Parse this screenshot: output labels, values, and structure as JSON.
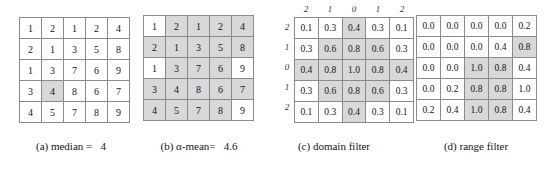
{
  "figure": {
    "panels": [
      {
        "id": "a",
        "caption": "(a) median =   4",
        "show_labels": false,
        "value_type": "int",
        "col_labels": [],
        "row_labels": [],
        "rows": [
          [
            {
              "v": "1",
              "hl": false
            },
            {
              "v": "2",
              "hl": false
            },
            {
              "v": "1",
              "hl": false
            },
            {
              "v": "2",
              "hl": false
            },
            {
              "v": "4",
              "hl": false
            }
          ],
          [
            {
              "v": "2",
              "hl": false
            },
            {
              "v": "1",
              "hl": false
            },
            {
              "v": "3",
              "hl": false
            },
            {
              "v": "5",
              "hl": false
            },
            {
              "v": "8",
              "hl": false
            }
          ],
          [
            {
              "v": "1",
              "hl": false
            },
            {
              "v": "3",
              "hl": false
            },
            {
              "v": "7",
              "hl": false
            },
            {
              "v": "6",
              "hl": false
            },
            {
              "v": "9",
              "hl": false
            }
          ],
          [
            {
              "v": "3",
              "hl": false
            },
            {
              "v": "4",
              "hl": true
            },
            {
              "v": "8",
              "hl": false
            },
            {
              "v": "6",
              "hl": false
            },
            {
              "v": "7",
              "hl": false
            }
          ],
          [
            {
              "v": "4",
              "hl": false
            },
            {
              "v": "5",
              "hl": false
            },
            {
              "v": "7",
              "hl": false
            },
            {
              "v": "8",
              "hl": false
            },
            {
              "v": "9",
              "hl": false
            }
          ]
        ]
      },
      {
        "id": "b",
        "caption": "(b) α-mean=   4.6",
        "show_labels": false,
        "value_type": "int",
        "col_labels": [],
        "row_labels": [],
        "rows": [
          [
            {
              "v": "1",
              "hl": false
            },
            {
              "v": "2",
              "hl": true
            },
            {
              "v": "1",
              "hl": true
            },
            {
              "v": "2",
              "hl": true
            },
            {
              "v": "4",
              "hl": true
            }
          ],
          [
            {
              "v": "2",
              "hl": true
            },
            {
              "v": "1",
              "hl": true
            },
            {
              "v": "3",
              "hl": true
            },
            {
              "v": "5",
              "hl": true
            },
            {
              "v": "8",
              "hl": true
            }
          ],
          [
            {
              "v": "1",
              "hl": false
            },
            {
              "v": "3",
              "hl": true
            },
            {
              "v": "7",
              "hl": true
            },
            {
              "v": "6",
              "hl": true
            },
            {
              "v": "9",
              "hl": false
            }
          ],
          [
            {
              "v": "3",
              "hl": true
            },
            {
              "v": "4",
              "hl": true
            },
            {
              "v": "8",
              "hl": true
            },
            {
              "v": "6",
              "hl": true
            },
            {
              "v": "7",
              "hl": true
            }
          ],
          [
            {
              "v": "4",
              "hl": true
            },
            {
              "v": "5",
              "hl": true
            },
            {
              "v": "7",
              "hl": true
            },
            {
              "v": "8",
              "hl": true
            },
            {
              "v": "9",
              "hl": false
            }
          ]
        ]
      },
      {
        "id": "c",
        "caption": "(c) domain filter",
        "show_labels": true,
        "value_type": "dec",
        "col_labels": [
          "2",
          "1",
          "0",
          "1",
          "2"
        ],
        "row_labels": [
          "2",
          "1",
          "0",
          "1",
          "2"
        ],
        "rows": [
          [
            {
              "v": "0.1",
              "hl": false
            },
            {
              "v": "0.3",
              "hl": false
            },
            {
              "v": "0.4",
              "hl": true
            },
            {
              "v": "0.3",
              "hl": false
            },
            {
              "v": "0.1",
              "hl": false
            }
          ],
          [
            {
              "v": "0.3",
              "hl": false
            },
            {
              "v": "0.6",
              "hl": true
            },
            {
              "v": "0.8",
              "hl": true
            },
            {
              "v": "0.6",
              "hl": true
            },
            {
              "v": "0.3",
              "hl": false
            }
          ],
          [
            {
              "v": "0.4",
              "hl": true
            },
            {
              "v": "0.8",
              "hl": true
            },
            {
              "v": "1.0",
              "hl": true
            },
            {
              "v": "0.8",
              "hl": true
            },
            {
              "v": "0.4",
              "hl": true
            }
          ],
          [
            {
              "v": "0.3",
              "hl": false
            },
            {
              "v": "0.6",
              "hl": true
            },
            {
              "v": "0.8",
              "hl": true
            },
            {
              "v": "0.6",
              "hl": true
            },
            {
              "v": "0.3",
              "hl": false
            }
          ],
          [
            {
              "v": "0.1",
              "hl": false
            },
            {
              "v": "0.3",
              "hl": false
            },
            {
              "v": "0.4",
              "hl": true
            },
            {
              "v": "0.3",
              "hl": false
            },
            {
              "v": "0.1",
              "hl": false
            }
          ]
        ]
      },
      {
        "id": "d",
        "caption": "(d) range filter",
        "show_labels": false,
        "value_type": "dec",
        "col_labels": [],
        "row_labels": [],
        "rows": [
          [
            {
              "v": "0.0",
              "hl": false
            },
            {
              "v": "0.0",
              "hl": false
            },
            {
              "v": "0.0",
              "hl": false
            },
            {
              "v": "0.0",
              "hl": false
            },
            {
              "v": "0.2",
              "hl": false
            }
          ],
          [
            {
              "v": "0.0",
              "hl": false
            },
            {
              "v": "0.0",
              "hl": false
            },
            {
              "v": "0.0",
              "hl": false
            },
            {
              "v": "0.4",
              "hl": false
            },
            {
              "v": "0.8",
              "hl": true
            }
          ],
          [
            {
              "v": "0.0",
              "hl": false
            },
            {
              "v": "0.0",
              "hl": false
            },
            {
              "v": "1.0",
              "hl": true
            },
            {
              "v": "0.8",
              "hl": true
            },
            {
              "v": "0.4",
              "hl": false
            }
          ],
          [
            {
              "v": "0.0",
              "hl": false
            },
            {
              "v": "0.2",
              "hl": false
            },
            {
              "v": "0.8",
              "hl": true
            },
            {
              "v": "0.8",
              "hl": true
            },
            {
              "v": "1.0",
              "hl": false
            }
          ],
          [
            {
              "v": "0.2",
              "hl": false
            },
            {
              "v": "0.4",
              "hl": false
            },
            {
              "v": "1.0",
              "hl": true
            },
            {
              "v": "0.8",
              "hl": true
            },
            {
              "v": "0.4",
              "hl": false
            }
          ]
        ]
      }
    ]
  },
  "chart_data": {
    "type": "table",
    "panels": [
      {
        "label": "(a) median =   4",
        "values": [
          [
            1,
            2,
            1,
            2,
            4
          ],
          [
            2,
            1,
            3,
            5,
            8
          ],
          [
            1,
            3,
            7,
            6,
            9
          ],
          [
            3,
            4,
            8,
            6,
            7
          ],
          [
            4,
            5,
            7,
            8,
            9
          ]
        ],
        "highlighted": [
          [
            3,
            1
          ]
        ],
        "result": 4
      },
      {
        "label": "(b) α-mean=   4.6",
        "values": [
          [
            1,
            2,
            1,
            2,
            4
          ],
          [
            2,
            1,
            3,
            5,
            8
          ],
          [
            1,
            3,
            7,
            6,
            9
          ],
          [
            3,
            4,
            8,
            6,
            7
          ],
          [
            4,
            5,
            7,
            8,
            9
          ]
        ],
        "highlighted": [
          [
            0,
            1
          ],
          [
            0,
            2
          ],
          [
            0,
            3
          ],
          [
            0,
            4
          ],
          [
            1,
            0
          ],
          [
            1,
            1
          ],
          [
            1,
            2
          ],
          [
            1,
            3
          ],
          [
            1,
            4
          ],
          [
            2,
            1
          ],
          [
            2,
            2
          ],
          [
            2,
            3
          ],
          [
            3,
            0
          ],
          [
            3,
            1
          ],
          [
            3,
            2
          ],
          [
            3,
            3
          ],
          [
            3,
            4
          ],
          [
            4,
            0
          ],
          [
            4,
            1
          ],
          [
            4,
            2
          ],
          [
            4,
            3
          ]
        ],
        "result": 4.6
      },
      {
        "label": "(c) domain filter",
        "col_labels": [
          2,
          1,
          0,
          1,
          2
        ],
        "row_labels": [
          2,
          1,
          0,
          1,
          2
        ],
        "values": [
          [
            0.1,
            0.3,
            0.4,
            0.3,
            0.1
          ],
          [
            0.3,
            0.6,
            0.8,
            0.6,
            0.3
          ],
          [
            0.4,
            0.8,
            1.0,
            0.8,
            0.4
          ],
          [
            0.3,
            0.6,
            0.8,
            0.6,
            0.3
          ],
          [
            0.1,
            0.3,
            0.4,
            0.3,
            0.1
          ]
        ],
        "highlighted": [
          [
            0,
            2
          ],
          [
            1,
            1
          ],
          [
            1,
            2
          ],
          [
            1,
            3
          ],
          [
            2,
            0
          ],
          [
            2,
            1
          ],
          [
            2,
            2
          ],
          [
            2,
            3
          ],
          [
            2,
            4
          ],
          [
            3,
            1
          ],
          [
            3,
            2
          ],
          [
            3,
            3
          ],
          [
            4,
            2
          ]
        ]
      },
      {
        "label": "(d) range filter",
        "values": [
          [
            0.0,
            0.0,
            0.0,
            0.0,
            0.2
          ],
          [
            0.0,
            0.0,
            0.0,
            0.4,
            0.8
          ],
          [
            0.0,
            0.0,
            1.0,
            0.8,
            0.4
          ],
          [
            0.0,
            0.2,
            0.8,
            0.8,
            1.0
          ],
          [
            0.2,
            0.4,
            1.0,
            0.8,
            0.4
          ]
        ],
        "highlighted": [
          [
            1,
            4
          ],
          [
            2,
            2
          ],
          [
            2,
            3
          ],
          [
            3,
            2
          ],
          [
            3,
            3
          ],
          [
            4,
            2
          ],
          [
            4,
            3
          ]
        ]
      }
    ]
  }
}
